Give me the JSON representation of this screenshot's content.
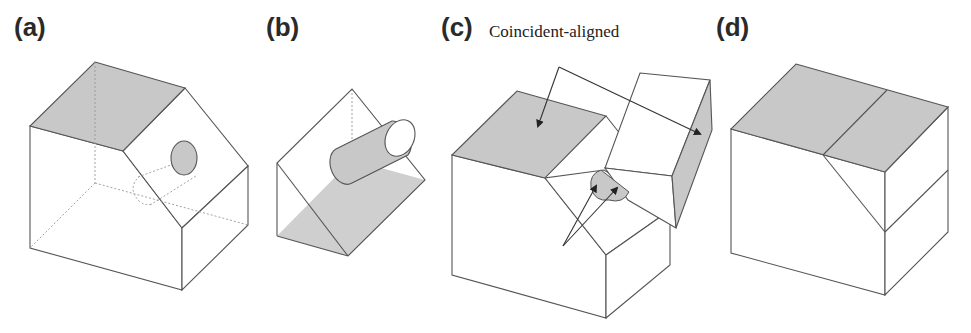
{
  "figure": {
    "panels": [
      {
        "id": "a",
        "label": "(a)",
        "description": "House-shaped block with a gray top face, sloped roof face and a cylindrical hole"
      },
      {
        "id": "b",
        "label": "(b)",
        "description": "Triangular prism wedge with a gray base face and a protruding cylinder"
      },
      {
        "id": "c",
        "label": "(c)",
        "description": "Assembly of block and wedge with constraint annotations"
      },
      {
        "id": "d",
        "label": "(d)",
        "description": "Assembled rectangular block with gray top face"
      }
    ],
    "annotations": {
      "coincident": "Coincident-aligned",
      "concentric": "Concentric"
    },
    "colors": {
      "face_gray": "#c8c8c8",
      "edge": "#555555",
      "background": "#ffffff"
    }
  }
}
